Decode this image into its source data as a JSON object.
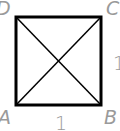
{
  "diagram": {
    "type": "square-with-diagonals",
    "vertices": {
      "A": {
        "label": "A",
        "x": 16,
        "y": 105
      },
      "B": {
        "label": "B",
        "x": 101,
        "y": 105
      },
      "C": {
        "label": "C",
        "x": 101,
        "y": 17
      },
      "D": {
        "label": "D",
        "x": 16,
        "y": 17
      }
    },
    "side_labels": {
      "bottom": "1",
      "right": "1"
    },
    "colors": {
      "stroke": "#000000",
      "label": "#9a9a9a",
      "background": "#ffffff"
    }
  }
}
